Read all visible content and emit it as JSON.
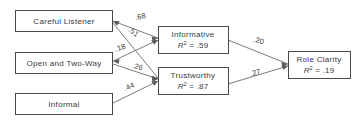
{
  "diagram": {
    "type": "path-diagram",
    "nodes": [
      {
        "id": "careful-listener",
        "label": "Careful Listener",
        "r2": null,
        "column": "exogenous"
      },
      {
        "id": "open-and-two-way",
        "label": "Open and Two-Way",
        "r2": null,
        "column": "exogenous"
      },
      {
        "id": "informal",
        "label": "Informal",
        "r2": null,
        "column": "exogenous"
      },
      {
        "id": "informative",
        "label": "Informative",
        "r2_prefix": "R",
        "r2_exponent": "2",
        "r2_value": "= .59",
        "r2_full": "R2 = .59",
        "column": "mediator"
      },
      {
        "id": "trustworthy",
        "label": "Trustworthy",
        "r2_prefix": "R",
        "r2_exponent": "2",
        "r2_value": "= .87",
        "r2_full": "R2 = .87",
        "column": "mediator"
      },
      {
        "id": "role-clarity",
        "label": "Role Clarity",
        "r2_prefix": "R",
        "r2_exponent": "2",
        "r2_value": "= .19",
        "r2_full": "R2 = .19",
        "column": "endogenous"
      }
    ],
    "edges": [
      {
        "id": "careful-listener-to-informative",
        "from": "careful-listener",
        "to": "informative",
        "coefficient": ".68"
      },
      {
        "id": "careful-listener-to-trustworthy",
        "from": "careful-listener",
        "to": "trustworthy",
        "coefficient": ".51"
      },
      {
        "id": "open-and-two-way-to-informative",
        "from": "open-and-two-way",
        "to": "informative",
        "coefficient": ".18"
      },
      {
        "id": "open-and-two-way-to-trustworthy",
        "from": "open-and-two-way",
        "to": "trustworthy",
        "coefficient": ".26"
      },
      {
        "id": "informal-to-trustworthy",
        "from": "informal",
        "to": "trustworthy",
        "coefficient": ".44"
      },
      {
        "id": "informative-to-role-clarity",
        "from": "informative",
        "to": "role-clarity",
        "coefficient": ".20"
      },
      {
        "id": "trustworthy-to-role-clarity",
        "from": "trustworthy",
        "to": "role-clarity",
        "coefficient": ".27"
      }
    ],
    "colors": {
      "background": "#ffffff",
      "box_stroke": "#4a4a4a",
      "line_stroke": "#5a5a5a",
      "text": "#3a3a3a"
    }
  }
}
